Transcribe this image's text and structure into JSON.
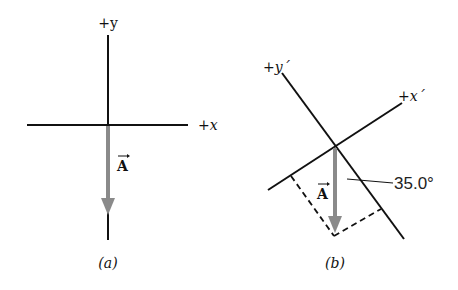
{
  "panel_a": {
    "caption": "(a)",
    "y_axis_label": "+y",
    "x_axis_label": "+x",
    "vector_label": "A"
  },
  "panel_b": {
    "caption": "(b)",
    "y_axis_label": "+y´",
    "x_axis_label": "+x´",
    "vector_label": "A",
    "angle_label": "35.0°"
  },
  "colors": {
    "axis": "#111111",
    "vector": "#8a8a8a",
    "dashed": "#111111"
  }
}
